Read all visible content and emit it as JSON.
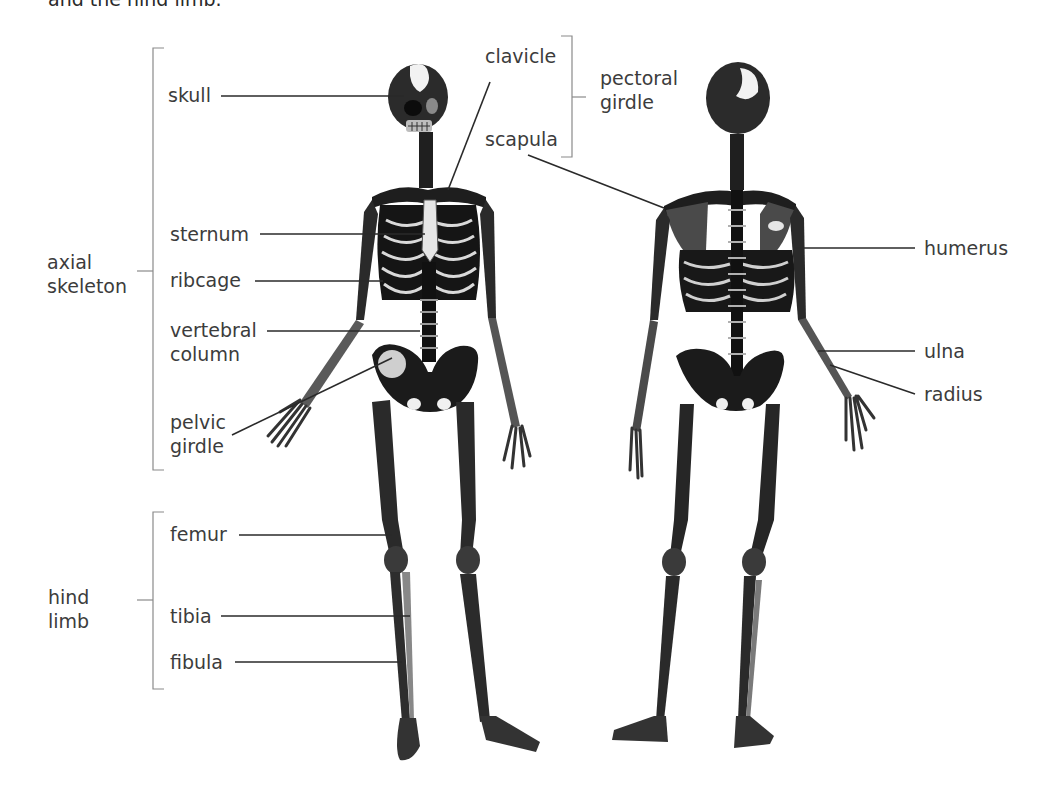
{
  "caption": "and the hind limb.",
  "groups": {
    "axial": {
      "line1": "axial",
      "line2": "skeleton"
    },
    "hind": {
      "line1": "hind",
      "line2": "limb"
    },
    "pectoral": {
      "line1": "pectoral",
      "line2": "girdle"
    }
  },
  "labels": {
    "skull": "skull",
    "sternum": "sternum",
    "ribcage": "ribcage",
    "vertebral_1": "vertebral",
    "vertebral_2": "column",
    "pelvic_1": "pelvic",
    "pelvic_2": "girdle",
    "femur": "femur",
    "tibia": "tibia",
    "fibula": "fibula",
    "clavicle": "clavicle",
    "scapula": "scapula",
    "humerus": "humerus",
    "ulna": "ulna",
    "radius": "radius"
  },
  "figures": {
    "front": "front-view skeleton",
    "back": "back-view skeleton"
  }
}
